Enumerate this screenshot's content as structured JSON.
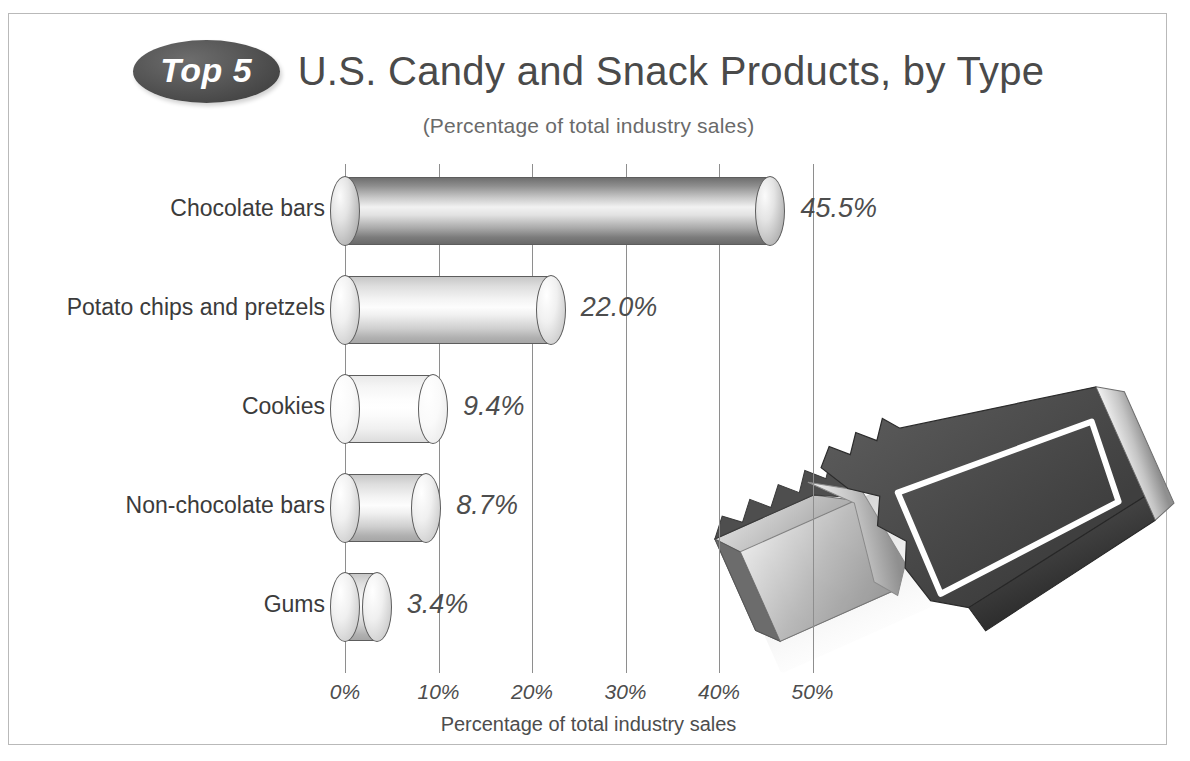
{
  "header": {
    "badge_label": "Top 5",
    "title": "U.S. Candy and Snack Products, by Type",
    "subtitle": "(Percentage of total industry sales)"
  },
  "illustration": {
    "name": "candy-bar-with-bite",
    "wrapper_color": "#4a4a4a",
    "foil_color": "#9a9a9a",
    "outline_color": "#ffffff"
  },
  "bottom_caption": "Source: Manufacturing Confectioner",
  "chart_data": {
    "type": "bar",
    "orientation": "horizontal",
    "title": "U.S. Candy and Snack Products, by Type",
    "subtitle": "(Percentage of total industry sales)",
    "xlabel": "Percentage of total industry sales",
    "ylabel": "",
    "xlim": [
      0,
      50
    ],
    "xticks": [
      0,
      10,
      20,
      30,
      40,
      50
    ],
    "xtick_labels": [
      "0%",
      "10%",
      "20%",
      "30%",
      "40%",
      "50%"
    ],
    "grid": true,
    "grid_axis": "x",
    "legend": false,
    "categories": [
      "Chocolate bars",
      "Potato chips and pretzels",
      "Cookies",
      "Non-chocolate bars",
      "Gums"
    ],
    "values": [
      45.5,
      22.0,
      9.4,
      8.7,
      3.4
    ],
    "value_labels": [
      "45.5%",
      "22.0%",
      "9.4%",
      "8.7%",
      "3.4%"
    ],
    "bars": [
      {
        "category": "Chocolate bars",
        "value": 45.5,
        "label": "45.5%",
        "shade": "dark"
      },
      {
        "category": "Potato chips and pretzels",
        "value": 22.0,
        "label": "22.0%",
        "shade": "mid"
      },
      {
        "category": "Cookies",
        "value": 9.4,
        "label": "9.4%",
        "shade": "light"
      },
      {
        "category": "Non-chocolate bars",
        "value": 8.7,
        "label": "8.7%",
        "shade": "mid"
      },
      {
        "category": "Gums",
        "value": 3.4,
        "label": "3.4%",
        "shade": "mid"
      }
    ],
    "colors": {
      "gridline": "#8e8e8e",
      "text": "#4d4d4d",
      "category_text": "#3b3b3b",
      "badge_background": "#4c4c4c",
      "badge_text": "#ffffff",
      "frame_border": "#b9b9b9",
      "background": "#ffffff"
    }
  }
}
